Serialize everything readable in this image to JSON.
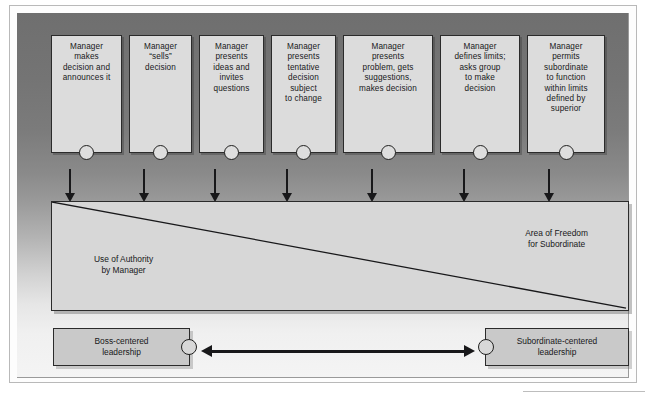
{
  "diagram": {
    "type": "continuum-diagram",
    "colors": {
      "panel_dark": "#6f6f6f",
      "panel_light": "#f4f4f4",
      "box_fill": "#dcdcdc",
      "anchor_fill": "#c9c9c9",
      "continuum_fill": "#d7d7d7",
      "stroke": "#18181a"
    },
    "options": [
      {
        "id": "option-1",
        "lines": [
          "Manager",
          "makes",
          "decision and",
          "announces it"
        ]
      },
      {
        "id": "option-2",
        "lines": [
          "Manager",
          "“sells”",
          "decision"
        ]
      },
      {
        "id": "option-3",
        "lines": [
          "Manager",
          "presents",
          "ideas and",
          "invites",
          "questions"
        ]
      },
      {
        "id": "option-4",
        "lines": [
          "Manager",
          "presents",
          "tentative",
          "decision",
          "subject",
          "to change"
        ]
      },
      {
        "id": "option-5",
        "lines": [
          "Manager",
          "presents",
          "problem, gets",
          "suggestions,",
          "makes decision"
        ]
      },
      {
        "id": "option-6",
        "lines": [
          "Manager",
          "defines limits;",
          "asks group",
          "to make",
          "decision"
        ]
      },
      {
        "id": "option-7",
        "lines": [
          "Manager",
          "permits",
          "subordinate",
          "to function",
          "within limits",
          "defined by",
          "superior"
        ]
      }
    ],
    "continuum": {
      "left_label": [
        "Use of Authority",
        "by Manager"
      ],
      "right_label": [
        "Area of Freedom",
        "for Subordinate"
      ]
    },
    "anchors": {
      "left": [
        "Boss-centered",
        "leadership"
      ],
      "right": [
        "Subordinate-centered",
        "leadership"
      ]
    }
  }
}
